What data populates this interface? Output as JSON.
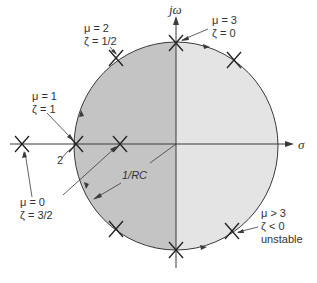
{
  "diagram": {
    "type": "root-locus",
    "colors": {
      "left_half_fill": "#c4c4c4",
      "right_half_fill": "#e4e4e4",
      "line": "#3a3a3a",
      "text": "#333333"
    },
    "axes": {
      "imag_label": "jω",
      "real_label": "σ"
    },
    "labels": {
      "mu2": {
        "line1": "μ = 2",
        "line2": "ζ = 1/2"
      },
      "mu3": {
        "line1": "μ = 3",
        "line2": "ζ = 0"
      },
      "mu1": {
        "line1": "μ = 1",
        "line2": "ζ = 1"
      },
      "mu0": {
        "line1": "μ = 0",
        "line2": "ζ = 3/2"
      },
      "unstable": {
        "line1": "μ > 3",
        "line2": "ζ < 0",
        "line3": "unstable"
      },
      "two": "2",
      "radius": "1/RC"
    }
  }
}
